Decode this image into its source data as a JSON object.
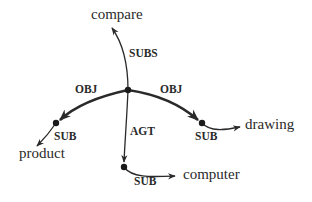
{
  "diagram": {
    "type": "semantic-network",
    "colors": {
      "ink": "#2a2a2a",
      "background": "#ffffff"
    },
    "nodes": {
      "compare": {
        "label": "compare"
      },
      "drawing": {
        "label": "drawing"
      },
      "product": {
        "label": "product"
      },
      "computer": {
        "label": "computer"
      }
    },
    "edges": {
      "subs": {
        "label": "SUBS",
        "from": "center",
        "to": "compare"
      },
      "obj_left": {
        "label": "OBJ",
        "from": "center",
        "to": "left-node"
      },
      "obj_right": {
        "label": "OBJ",
        "from": "center",
        "to": "right-node"
      },
      "agt": {
        "label": "AGT",
        "from": "center",
        "to": "bottom-node"
      },
      "sub_product": {
        "label": "SUB",
        "from": "left-node",
        "to": "product"
      },
      "sub_drawing": {
        "label": "SUB",
        "from": "right-node",
        "to": "drawing"
      },
      "sub_computer": {
        "label": "SUB",
        "from": "bottom-node",
        "to": "computer"
      }
    }
  }
}
